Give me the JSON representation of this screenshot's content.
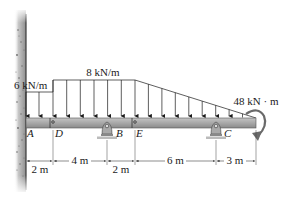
{
  "figure": {
    "loads": {
      "left_intensity": "6 kN/m",
      "main_intensity": "8 kN/m",
      "moment": "48 kN · m"
    },
    "points": {
      "A": "A",
      "D": "D",
      "B": "B",
      "E": "E",
      "C": "C"
    },
    "dimensions": {
      "AD": "2 m",
      "DB": "4 m",
      "BE": "2 m",
      "EC": "6 m",
      "C_end": "3 m"
    },
    "colors": {
      "beam": "#a8a8a8",
      "beam_edge": "#555555",
      "wall": "#b5b5b5",
      "support": "#9a9a9a",
      "ink": "#1a1a1a"
    }
  }
}
